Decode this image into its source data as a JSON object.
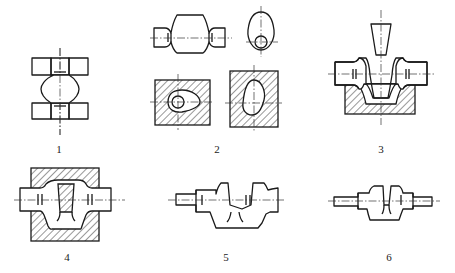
{
  "figure": {
    "steps": [
      {
        "id": 1,
        "label": "1",
        "content": "initial billet / preform with spherical center section"
      },
      {
        "id": 2,
        "label": "2",
        "content": "blocked forging with cross-sections in dies"
      },
      {
        "id": 3,
        "label": "3",
        "content": "punch piercing in lower die"
      },
      {
        "id": 4,
        "label": "4",
        "content": "closed die forging in upper and lower dies"
      },
      {
        "id": 5,
        "label": "5",
        "content": "forged crank throw"
      },
      {
        "id": 6,
        "label": "6",
        "content": "finished crank"
      }
    ]
  },
  "labels": {
    "l1": "1",
    "l2": "2",
    "l3": "3",
    "l4": "4",
    "l5": "5",
    "l6": "6"
  },
  "colors": {
    "line": "#1a1a1a",
    "background": "#ffffff"
  }
}
